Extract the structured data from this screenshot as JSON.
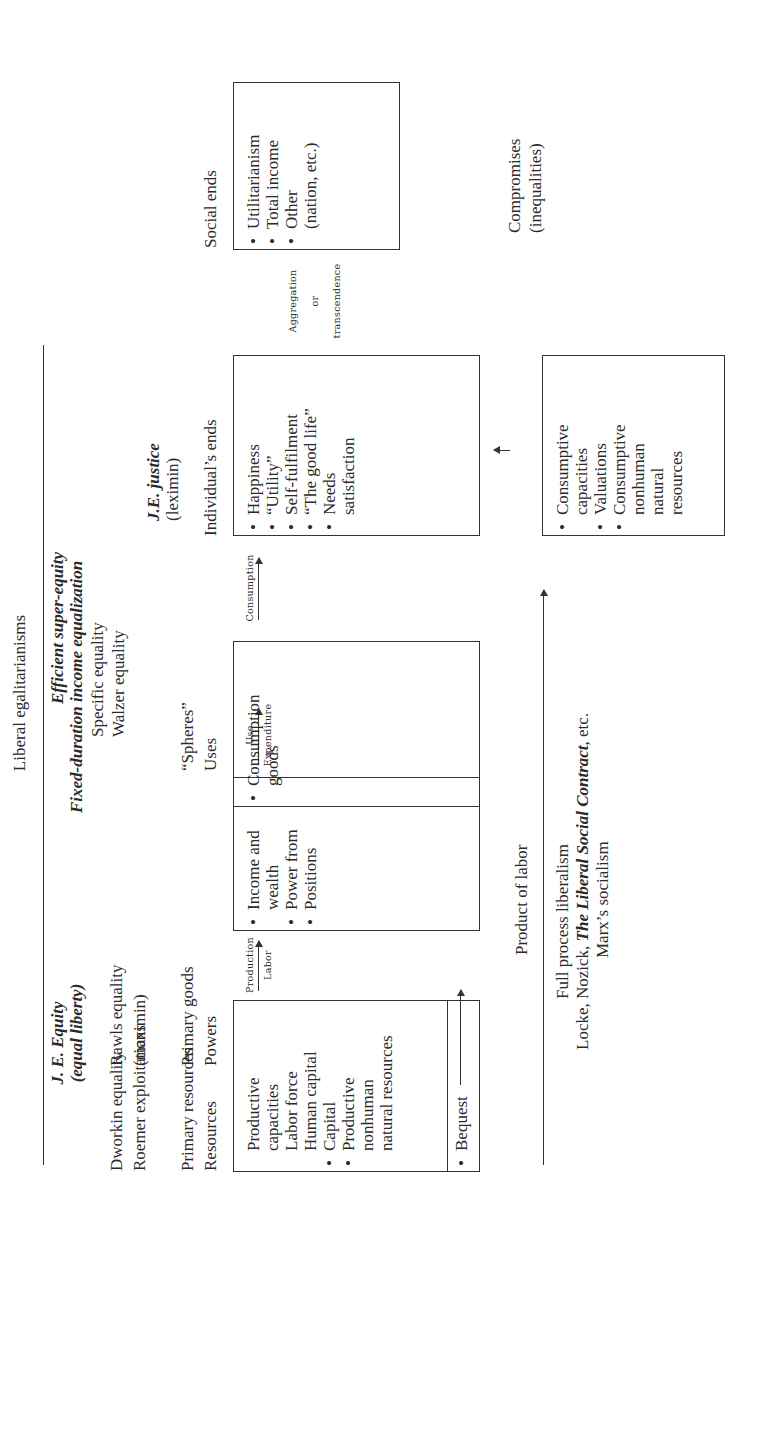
{
  "header": {
    "title": "Liberal egalitarianisms"
  },
  "columns": {
    "resources": {
      "theory_bold": "J. E. Equity",
      "theory_bold_sub": "(equal liberty)",
      "theories": [
        "Dworkin equality",
        "Roemer exploitations"
      ],
      "categories": [
        "Primary resources",
        "Resources"
      ],
      "box_items": [
        {
          "bullet": false,
          "text": "Productive"
        },
        {
          "bullet": false,
          "text": "capacities"
        },
        {
          "bullet": false,
          "text": "Labor force"
        },
        {
          "bullet": false,
          "text": "Human capital"
        },
        {
          "bullet": true,
          "text": "Capital"
        },
        {
          "bullet": true,
          "text": "Productive"
        },
        {
          "bullet": false,
          "text": "nonhuman"
        },
        {
          "bullet": false,
          "text": "natural resources"
        }
      ],
      "bequest": "Bequest"
    },
    "primary_goods": {
      "theories": [
        "Rawls equality",
        "(maximin)"
      ],
      "categories": [
        "Primary goods",
        "Powers"
      ],
      "box_items": [
        {
          "bullet": true,
          "text": "Income and"
        },
        {
          "bullet": false,
          "text": "wealth"
        },
        {
          "bullet": true,
          "text": "Power from"
        },
        {
          "bullet": true,
          "text": "Positions"
        }
      ]
    },
    "uses": {
      "theory_bold": [
        "Efficient super-equity",
        "Fixed-duration income equalization"
      ],
      "theories": [
        "Specific equality",
        "Walzer equality"
      ],
      "categories": [
        "“Spheres”",
        "Uses"
      ],
      "box_items": [
        {
          "bullet": true,
          "text": "Consumption"
        },
        {
          "bullet": false,
          "text": "goods"
        }
      ]
    },
    "individual_ends": {
      "theory_bold": "J.E. justice",
      "theory_sub": "(leximin)",
      "category": "Individual’s ends",
      "box_items": [
        {
          "bullet": true,
          "text": "Happiness"
        },
        {
          "bullet": true,
          "text": "“Utility”"
        },
        {
          "bullet": true,
          "text": "Self-fulfilment"
        },
        {
          "bullet": true,
          "text": "“The good life”"
        },
        {
          "bullet": true,
          "text": "Needs"
        },
        {
          "bullet": false,
          "text": "satisfaction"
        }
      ]
    },
    "social_ends": {
      "category": "Social ends",
      "box_items": [
        {
          "bullet": true,
          "text": "Utilitarianism"
        },
        {
          "bullet": true,
          "text": "Total income"
        },
        {
          "bullet": true,
          "text": "Other"
        },
        {
          "bullet": false,
          "text": "(nation, etc.)"
        }
      ],
      "compromises": [
        "Compromises",
        "(inequalities)"
      ]
    }
  },
  "arrows": {
    "production": {
      "top": "Production",
      "bottom": "Labor"
    },
    "use": {
      "top": "Use",
      "bottom": "Expenditure"
    },
    "consumption": {
      "top": "Consumption"
    },
    "aggregation": [
      "Aggregation",
      "or",
      "transcendence"
    ]
  },
  "consumptive_box": {
    "items": [
      {
        "bullet": true,
        "text": "Consumptive"
      },
      {
        "bullet": false,
        "text": "capacities"
      },
      {
        "bullet": true,
        "text": "Valuations"
      },
      {
        "bullet": true,
        "text": "Consumptive"
      },
      {
        "bullet": false,
        "text": "nonhuman"
      },
      {
        "bullet": false,
        "text": "natural"
      },
      {
        "bullet": false,
        "text": "resources"
      }
    ]
  },
  "footer": {
    "product_of_labor": "Product of labor",
    "full_process": "Full process liberalism",
    "authors_prefix": "Locke, Nozick, ",
    "authors_bold": "The Liberal Social Contract",
    "authors_suffix": ", etc.",
    "marx": "Marx’s socialism"
  }
}
